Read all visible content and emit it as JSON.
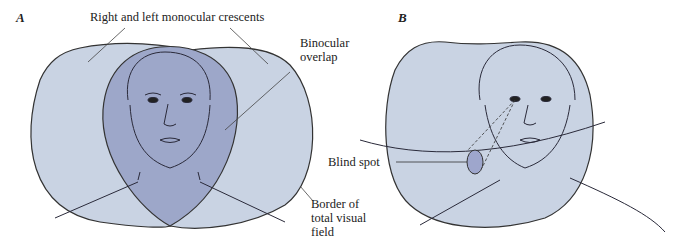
{
  "figure": {
    "panels": [
      {
        "letter": "A",
        "labels": {
          "crescents": "Right and left monocular crescents",
          "binocular_line1": "Binocular",
          "binocular_line2": "overlap",
          "border_line1": "Border of",
          "border_line2": "total visual",
          "border_line3": "field"
        }
      },
      {
        "letter": "B",
        "labels": {
          "blind_spot": "Blind spot"
        }
      }
    ],
    "colors": {
      "visual_field_fill": "#c9d3e3",
      "binocular_fill": "#9da7c9",
      "blind_spot_fill": "#9ea6cc",
      "outline": "#333333"
    }
  }
}
